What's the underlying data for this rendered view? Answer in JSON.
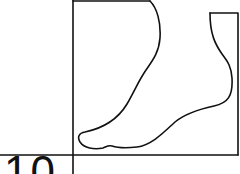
{
  "figure": {
    "label": "10",
    "line_color": "#111111",
    "background": "#ffffff"
  }
}
